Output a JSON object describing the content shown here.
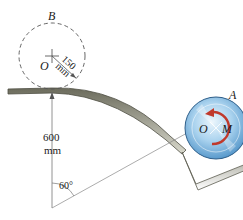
{
  "labels": {
    "point_B": "B",
    "point_O_top": "O",
    "radius_value": "150",
    "radius_unit": "mm",
    "height_value": "600",
    "height_unit": "mm",
    "angle": "60°",
    "point_O_disk": "O",
    "moment": "M",
    "point_A": "A"
  },
  "colors": {
    "track": "#8a8a7a",
    "track_dark": "#5d5d50",
    "disk_light": "#d8ecf8",
    "disk_mid": "#8fc3e6",
    "disk_dark": "#3d86c0",
    "moment_arrow": "#c0392b",
    "dimension_line": "#666666"
  }
}
